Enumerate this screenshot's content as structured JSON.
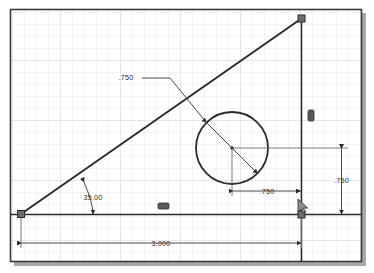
{
  "app": {
    "type": "cad-sketch-drawing",
    "title": "Parametric Sketch - Right Triangle with Hole"
  },
  "canvas": {
    "width": 374,
    "height": 273,
    "background_color": "#ffffff",
    "grid": {
      "visible": true,
      "spacing_px": 12,
      "minor_color": "#e8e8e8",
      "major_color": "#d2d2d2"
    },
    "border": {
      "color": "#3a3a3a",
      "shadow_color": "#a8a8a8"
    }
  },
  "geometry": {
    "triangle": {
      "vertices": [
        "bottom-left",
        "bottom-right",
        "top-right"
      ],
      "line_color": "#2b2b2b"
    },
    "circle": {
      "label": "hole",
      "diameter_value": ".750"
    }
  },
  "dimensions": [
    {
      "id": "diameter",
      "value": ".750",
      "kind": "diameter-leader",
      "target": "circle"
    },
    {
      "id": "angle",
      "value": "35.00",
      "kind": "angular",
      "target": "hypotenuse-to-base"
    },
    {
      "id": "horizontal-offset",
      "value": ".750",
      "kind": "linear-horizontal",
      "target": "circle-center-to-right-edge"
    },
    {
      "id": "vertical-offset",
      "value": ".750",
      "kind": "linear-vertical",
      "target": "circle-center-to-base"
    },
    {
      "id": "overall-width",
      "value": "3.000",
      "kind": "linear-horizontal",
      "target": "base-length"
    }
  ],
  "constraints": [
    {
      "id": "horizontal-constraint",
      "glyph": "horizontal-constraint-icon",
      "on": "base-line"
    },
    {
      "id": "vertical-constraint",
      "glyph": "vertical-constraint-icon",
      "on": "right-line"
    }
  ],
  "points": [
    {
      "id": "point-bottom-left",
      "shape": "square"
    },
    {
      "id": "point-bottom-right",
      "shape": "square"
    },
    {
      "id": "point-top-right",
      "shape": "square"
    },
    {
      "id": "point-circle-center",
      "shape": "dot"
    }
  ],
  "cursor": {
    "visible": true,
    "glyph": "pointer-cursor-icon"
  }
}
